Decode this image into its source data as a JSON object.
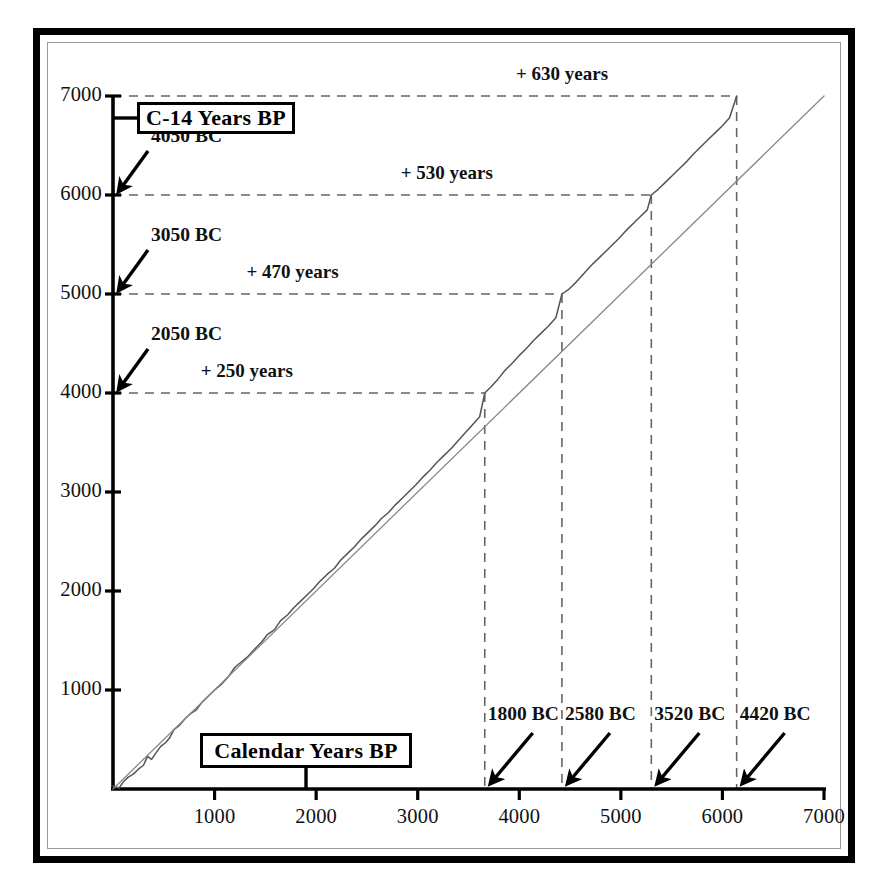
{
  "figure": {
    "title_y_box": "C-14 Years BP",
    "title_x_box": "Calendar Years BP"
  },
  "chart_data": {
    "type": "line",
    "title": "",
    "xlabel": "Calendar Years BP",
    "ylabel": "C-14 Years BP",
    "xlim": [
      0,
      7000
    ],
    "ylim": [
      0,
      7000
    ],
    "grid": false,
    "legend": "none",
    "xticks": [
      1000,
      2000,
      3000,
      4000,
      5000,
      6000,
      7000
    ],
    "yticks": [
      1000,
      2000,
      3000,
      4000,
      5000,
      6000,
      7000
    ],
    "xtick_labels": [
      "1000",
      "2000",
      "3000",
      "4000",
      "5000",
      "6000",
      "7000"
    ],
    "ytick_labels": [
      "1000",
      "2000",
      "3000",
      "4000",
      "5000",
      "6000",
      "7000"
    ],
    "series": [
      {
        "name": "calibration-curve",
        "style": "wiggly-line",
        "color": "#555555",
        "description": "Radiocarbon age versus calendar age calibration curve",
        "points": [
          [
            0,
            30
          ],
          [
            60,
            10
          ],
          [
            100,
            70
          ],
          [
            150,
            120
          ],
          [
            200,
            150
          ],
          [
            250,
            200
          ],
          [
            300,
            240
          ],
          [
            340,
            330
          ],
          [
            380,
            300
          ],
          [
            420,
            360
          ],
          [
            470,
            430
          ],
          [
            520,
            470
          ],
          [
            560,
            520
          ],
          [
            600,
            600
          ],
          [
            650,
            640
          ],
          [
            700,
            700
          ],
          [
            760,
            760
          ],
          [
            820,
            800
          ],
          [
            880,
            880
          ],
          [
            940,
            940
          ],
          [
            1000,
            1000
          ],
          [
            1070,
            1060
          ],
          [
            1140,
            1140
          ],
          [
            1200,
            1230
          ],
          [
            1260,
            1280
          ],
          [
            1330,
            1340
          ],
          [
            1400,
            1420
          ],
          [
            1460,
            1480
          ],
          [
            1520,
            1560
          ],
          [
            1590,
            1610
          ],
          [
            1650,
            1700
          ],
          [
            1720,
            1760
          ],
          [
            1780,
            1830
          ],
          [
            1850,
            1900
          ],
          [
            1910,
            1960
          ],
          [
            1980,
            2030
          ],
          [
            2040,
            2100
          ],
          [
            2110,
            2170
          ],
          [
            2180,
            2230
          ],
          [
            2240,
            2310
          ],
          [
            2310,
            2380
          ],
          [
            2380,
            2450
          ],
          [
            2440,
            2520
          ],
          [
            2510,
            2590
          ],
          [
            2580,
            2660
          ],
          [
            2640,
            2730
          ],
          [
            2710,
            2790
          ],
          [
            2780,
            2870
          ],
          [
            2850,
            2940
          ],
          [
            2910,
            3000
          ],
          [
            2980,
            3070
          ],
          [
            3050,
            3150
          ],
          [
            3120,
            3220
          ],
          [
            3190,
            3300
          ],
          [
            3260,
            3370
          ],
          [
            3330,
            3440
          ],
          [
            3400,
            3520
          ],
          [
            3470,
            3600
          ],
          [
            3540,
            3680
          ],
          [
            3610,
            3760
          ],
          [
            3660,
            4000
          ],
          [
            3720,
            4060
          ],
          [
            3790,
            4140
          ],
          [
            3860,
            4230
          ],
          [
            3930,
            4300
          ],
          [
            4000,
            4380
          ],
          [
            4070,
            4450
          ],
          [
            4140,
            4530
          ],
          [
            4210,
            4600
          ],
          [
            4290,
            4680
          ],
          [
            4360,
            4760
          ],
          [
            4420,
            5000
          ],
          [
            4490,
            5050
          ],
          [
            4560,
            5120
          ],
          [
            4630,
            5200
          ],
          [
            4700,
            5280
          ],
          [
            4770,
            5350
          ],
          [
            4840,
            5420
          ],
          [
            4910,
            5490
          ],
          [
            4980,
            5560
          ],
          [
            5050,
            5640
          ],
          [
            5120,
            5710
          ],
          [
            5190,
            5780
          ],
          [
            5260,
            5850
          ],
          [
            5300,
            6000
          ],
          [
            5370,
            6060
          ],
          [
            5440,
            6130
          ],
          [
            5510,
            6200
          ],
          [
            5580,
            6270
          ],
          [
            5650,
            6340
          ],
          [
            5720,
            6420
          ],
          [
            5790,
            6490
          ],
          [
            5860,
            6560
          ],
          [
            5930,
            6630
          ],
          [
            6000,
            6700
          ],
          [
            6070,
            6780
          ],
          [
            6140,
            7000
          ]
        ]
      },
      {
        "name": "one-to-one-line",
        "style": "straight-line",
        "color": "#888888",
        "description": "1:1 reference line where radiocarbon age equals calendar age",
        "points": [
          [
            0,
            0
          ],
          [
            7000,
            7000
          ]
        ]
      }
    ],
    "callouts_y_axis": [
      {
        "label": "4050 BC",
        "c14_year": 6000
      },
      {
        "label": "3050 BC",
        "c14_year": 5000
      },
      {
        "label": "2050 BC",
        "c14_year": 4000
      }
    ],
    "callouts_x_axis": [
      {
        "label": "1800 BC",
        "calendar_year": 3660
      },
      {
        "label": "2580 BC",
        "calendar_year": 4420
      },
      {
        "label": "3520 BC",
        "calendar_year": 5300
      },
      {
        "label": "4420 BC",
        "calendar_year": 6140
      }
    ],
    "offset_annotations": [
      {
        "label": "+ 630 years",
        "c14_year": 7000,
        "calendar_year": 6140,
        "offset_years": 630
      },
      {
        "label": "+ 530 years",
        "c14_year": 6000,
        "calendar_year": 5300,
        "offset_years": 530
      },
      {
        "label": "+ 470 years",
        "c14_year": 5000,
        "calendar_year": 4420,
        "offset_years": 470
      },
      {
        "label": "+ 250 years",
        "c14_year": 4000,
        "calendar_year": 3660,
        "offset_years": 250
      }
    ]
  },
  "colors": {
    "frame": "#000000",
    "inner_frame": "#9a9a9a",
    "axis": "#000000",
    "curve": "#555555",
    "reference_line": "#888888",
    "dashed_guide": "#666666",
    "text": "#111111"
  }
}
